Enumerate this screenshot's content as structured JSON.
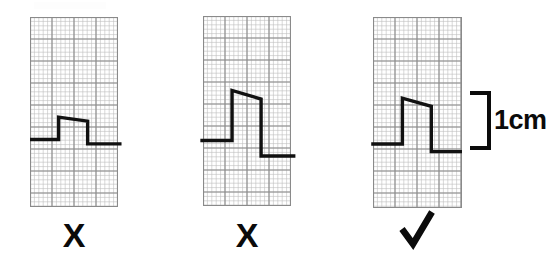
{
  "figure": {
    "background_color": "#ffffff",
    "width": 556,
    "height": 263,
    "trace_color": "#111111",
    "grid_fine_color": "#bdbdbd",
    "grid_major_color": "#8a8a8a",
    "grid_border_color": "#8a8a8a",
    "grid_fine_pitch_px": 4.4,
    "grid_major_pitch_px": 22
  },
  "panels": [
    {
      "id": "panel-1",
      "name": "calibration-pulse-too-small",
      "verdict_symbol": "X",
      "verdict_name": "cross-mark",
      "verdict_meaning": "incorrect",
      "x": 30,
      "y": 17,
      "width": 88,
      "height": 190,
      "major_cols": 4,
      "major_rows": 9,
      "pulse": {
        "baseline_left_y_frac": 0.645,
        "top_left_y_frac": 0.527,
        "top_right_y_frac": 0.548,
        "baseline_right_y_frac": 0.668,
        "rise_x_frac": 0.325,
        "fall_x_frac": 0.655,
        "start_x_frac": 0.0,
        "end_x_frac": 1.04,
        "height_in_cm": 0.5,
        "stroke_width": 3.4
      }
    },
    {
      "id": "panel-2",
      "name": "calibration-pulse-too-large",
      "verdict_symbol": "X",
      "verdict_name": "cross-mark",
      "verdict_meaning": "incorrect",
      "x": 203,
      "y": 16,
      "width": 88,
      "height": 190,
      "major_cols": 4,
      "major_rows": 9,
      "pulse": {
        "baseline_left_y_frac": 0.655,
        "top_left_y_frac": 0.392,
        "top_right_y_frac": 0.437,
        "baseline_right_y_frac": 0.737,
        "rise_x_frac": 0.33,
        "fall_x_frac": 0.66,
        "start_x_frac": -0.03,
        "end_x_frac": 1.05,
        "height_in_cm": 1.5,
        "stroke_width": 3.4
      }
    },
    {
      "id": "panel-3",
      "name": "calibration-pulse-correct",
      "verdict_symbol": "✓",
      "verdict_name": "check-mark",
      "verdict_meaning": "correct",
      "x": 373,
      "y": 17,
      "width": 89,
      "height": 191,
      "major_cols": 4,
      "major_rows": 9,
      "pulse": {
        "baseline_left_y_frac": 0.665,
        "top_left_y_frac": 0.425,
        "top_right_y_frac": 0.468,
        "baseline_right_y_frac": 0.705,
        "rise_x_frac": 0.33,
        "fall_x_frac": 0.655,
        "start_x_frac": -0.02,
        "end_x_frac": 1.0,
        "height_in_cm": 1.0,
        "stroke_width": 3.4
      }
    }
  ],
  "annotation": {
    "name": "scale-bracket",
    "label": "1cm",
    "bracket_top_y": 93,
    "bracket_bottom_y": 148,
    "bracket_left_x": 470,
    "bracket_right_x": 489,
    "stroke_width": 4,
    "label_x": 494,
    "label_y": 107,
    "color": "#0b0b0b"
  },
  "verdicts": [
    {
      "symbol": "X",
      "center_x": 74,
      "y": 218,
      "size": 34
    },
    {
      "symbol": "X",
      "center_x": 247,
      "y": 218,
      "size": 34
    },
    {
      "symbol": "✓",
      "center_x": 417,
      "y": 213,
      "size": 40
    }
  ]
}
